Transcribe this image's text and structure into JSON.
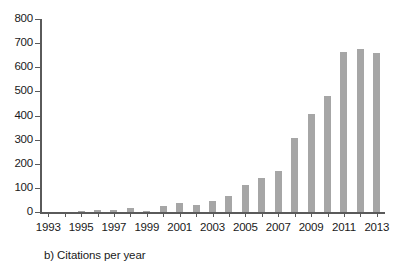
{
  "chart_data": {
    "type": "bar",
    "title": "",
    "caption": "b) Citations per year",
    "xlabel": "",
    "ylabel": "",
    "ylim": [
      0,
      800
    ],
    "ytick_step": 100,
    "yticks": [
      0,
      100,
      200,
      300,
      400,
      500,
      600,
      700,
      800
    ],
    "ytick_labels": [
      "0",
      "100",
      "200",
      "300",
      "400",
      "500",
      "600",
      "700",
      "800"
    ],
    "xlim": [
      1993,
      2013
    ],
    "categories": [
      1993,
      1994,
      1995,
      1996,
      1997,
      1998,
      1999,
      2000,
      2001,
      2002,
      2003,
      2004,
      2005,
      2006,
      2007,
      2008,
      2009,
      2010,
      2011,
      2012,
      2013
    ],
    "xtick_labels": [
      "1993",
      "1995",
      "1997",
      "1999",
      "2001",
      "2003",
      "2005",
      "2007",
      "2009",
      "2011",
      "2013"
    ],
    "xtick_label_years": [
      1993,
      1995,
      1997,
      1999,
      2001,
      2003,
      2005,
      2007,
      2009,
      2011,
      2013
    ],
    "values": [
      0,
      1,
      5,
      10,
      7,
      18,
      5,
      25,
      38,
      28,
      45,
      65,
      110,
      140,
      170,
      305,
      405,
      480,
      665,
      675,
      660
    ],
    "series": [
      {
        "name": "Citations per year",
        "values": [
          0,
          1,
          5,
          10,
          7,
          18,
          5,
          25,
          38,
          28,
          45,
          65,
          110,
          140,
          170,
          305,
          405,
          480,
          665,
          675,
          660
        ]
      }
    ],
    "bar_color": "#a6a6a6",
    "axis_color": "#5a5a5a",
    "background_color": "#ffffff",
    "grid": false,
    "legend": false,
    "legend_position": "none"
  }
}
